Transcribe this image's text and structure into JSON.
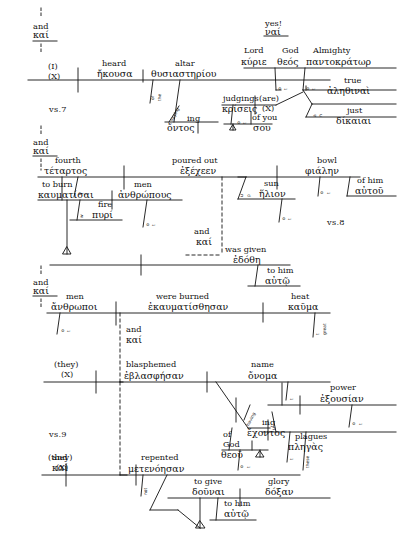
{
  "document": {
    "title": "Greek syntactical sentence diagram",
    "passage_markers": [
      "vs.7",
      "vs.8",
      "vs.9"
    ]
  },
  "connectors": [
    {
      "id": "conn-top",
      "english": "and",
      "greek": "καί"
    },
    {
      "id": "conn-mid",
      "english": "and",
      "greek": "καί"
    },
    {
      "id": "conn-bottom",
      "english": "and",
      "greek": "καί"
    }
  ],
  "verse7": {
    "marker": "vs.7",
    "subject": {
      "english": "(I)",
      "placeholder": "(X)"
    },
    "verb": {
      "english": "heard",
      "greek": "ἤκουσα"
    },
    "object": {
      "english": "altar",
      "greek": "θυσιαστηρίου"
    },
    "mod_of_the": {
      "parts": [
        "of",
        "the"
      ]
    },
    "participle": {
      "english": "saying",
      "greek": "ὄντος",
      "rot": "saying"
    },
    "exclaim": {
      "english": "yes!",
      "greek": "ναί"
    },
    "lord": {
      "english": "Lord",
      "greek": "κύριε"
    },
    "god": {
      "english": "God",
      "greek": "θεός"
    },
    "almighty": {
      "english": "Almighty",
      "greek": "παντοκράτωρ"
    },
    "judgings": {
      "english": "judgings",
      "greek": "κρίσεις"
    },
    "are": {
      "english": "(are)",
      "placeholder": "(X)"
    },
    "ofyou": {
      "english": "of you",
      "greek": "σου"
    },
    "true": {
      "english": "true",
      "greek": "ἀληθιναὶ"
    },
    "just": {
      "english": "just",
      "greek": "δίκαιαι"
    },
    "mods": {
      "of_the_a": [
        "o",
        "f",
        "t",
        "h",
        "e"
      ],
      "the_b": [
        "t",
        "h",
        "e"
      ],
      "and_c": [
        "a",
        "n",
        "d"
      ]
    }
  },
  "verse8": {
    "marker": "vs.8",
    "subject": {
      "english": "fourth",
      "greek": "τέταρτος"
    },
    "verb": {
      "english": "poured out",
      "greek": "ἐξέχεεν"
    },
    "object": {
      "english": "bowl",
      "greek": "φιάλην"
    },
    "ofhim": {
      "english": "of him",
      "greek": "αὐτοῦ"
    },
    "toburn": {
      "english": "to burn",
      "greek": "καυματίσαι"
    },
    "men": {
      "english": "men",
      "greek": "ἀνθρώπους"
    },
    "fire": {
      "english": "fire",
      "greek": "πυρί"
    },
    "sun": {
      "english": "sun",
      "greek": "ἥλιον"
    },
    "and": {
      "english": "and",
      "greek": "καί"
    },
    "wasgiven": {
      "english": "was given",
      "greek": "ἐδόθη"
    },
    "tohim": {
      "english": "to him",
      "greek": "αὐτῷ"
    },
    "mods": {
      "of_the": [
        "o",
        "f",
        "t",
        "h",
        "e"
      ],
      "with": [
        "w",
        "i",
        "t",
        "h"
      ],
      "of_the2": [
        "o",
        "f",
        "t",
        "h",
        "e"
      ],
      "upon": [
        "u",
        "p",
        "o",
        "n"
      ],
      "of_the3": [
        "o",
        "f",
        "t",
        "h",
        "e"
      ],
      "of_the4": [
        "o",
        "f",
        "t",
        "h",
        "e"
      ]
    }
  },
  "verse9": {
    "marker": "vs.9",
    "subject": {
      "english": "men",
      "greek": "ἄνθρωποι"
    },
    "verb": {
      "english": "were burned",
      "greek": "ἐκαυματίσθησαν"
    },
    "heat": {
      "english": "heat",
      "greek": "καῦμα"
    },
    "great": {
      "english": "great",
      "greek": "μέγα"
    },
    "and1": {
      "english": "and",
      "greek": "καί"
    },
    "subject2": {
      "english": "(they)",
      "placeholder": "(X)"
    },
    "verb2": {
      "english": "blasphemed",
      "greek": "ἐβλασφήσαν"
    },
    "name": {
      "english": "name",
      "greek": "ὄνομα"
    },
    "having": {
      "english": "having",
      "greek": "ἔχοντος",
      "rot": "having"
    },
    "ofgod": {
      "english": "of God",
      "greek": "θεοῦ"
    },
    "power": {
      "english": "power",
      "greek": "ἐξουσίαν"
    },
    "plagues": {
      "english": "plagues",
      "greek": "πληγὰς"
    },
    "these": {
      "english": "these",
      "greek": "ταύτας"
    },
    "and2": {
      "english": "and",
      "greek": "καί"
    },
    "subject3": {
      "english": "(they)",
      "placeholder": "(X)"
    },
    "verb3": {
      "english": "repented",
      "greek": "μετενόησαν"
    },
    "not": {
      "english": "not"
    },
    "togive": {
      "english": "to give",
      "greek": "δοῦναι"
    },
    "glory": {
      "english": "glory",
      "greek": "δόξαν"
    },
    "tohim": {
      "english": "to him",
      "greek": "αὐτῷ"
    },
    "mods": {
      "of_the": [
        "o",
        "f",
        "t",
        "h",
        "e"
      ],
      "the_great": [
        "t",
        "h",
        "e"
      ],
      "of_the2": [
        "o",
        "f",
        "t",
        "h",
        "e"
      ],
      "the_b": [
        "t",
        "h",
        "e"
      ],
      "over_the": [
        "o",
        "v",
        "e",
        "r",
        "t",
        "h",
        "e"
      ],
      "upon": [
        "u",
        "p",
        "o",
        "n"
      ],
      "the_c": [
        "t",
        "h",
        "e"
      ]
    }
  },
  "colors": {
    "ink": "#111111",
    "paper": "#ffffff"
  }
}
